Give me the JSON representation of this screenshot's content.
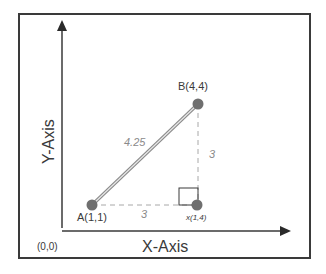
{
  "diagram": {
    "title": "",
    "x_axis_label": "X-Axis",
    "y_axis_label": "Y-Axis",
    "origin_label": "(0,0)",
    "points": [
      {
        "id": "A",
        "label": "A(1,1)",
        "x": 1,
        "y": 1
      },
      {
        "id": "B",
        "label": "B(4,4)",
        "x": 4,
        "y": 4
      },
      {
        "id": "X",
        "label": "x(1,4)",
        "x": 4,
        "y": 1
      }
    ],
    "segments": [
      {
        "from": "A",
        "to": "B",
        "style": "double-solid",
        "length_label": "4.25"
      },
      {
        "from": "A",
        "to": "X",
        "style": "dashed",
        "length_label": "3"
      },
      {
        "from": "X",
        "to": "B",
        "style": "dashed",
        "length_label": "3"
      }
    ],
    "right_angle_marker_at": "X"
  },
  "colors": {
    "frame": "#3a3a3a",
    "axis": "#3a3a3a",
    "point_fill": "#6f6f6f",
    "dashed_line": "#a8a8a8",
    "length_text": "#8a8a8a"
  }
}
